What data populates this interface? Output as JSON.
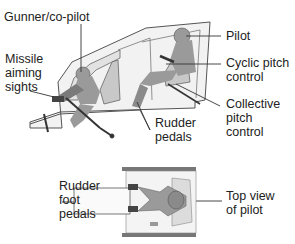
{
  "diagram": {
    "side_view": {
      "labels": {
        "gunner": "Gunner/co-pilot",
        "missile_line1": "Missile",
        "missile_line2": "aiming",
        "missile_line3": "sights",
        "pilot": "Pilot",
        "cyclic_line1": "Cyclic pitch",
        "cyclic_line2": "control",
        "collective_line1": "Collective",
        "collective_line2": "pitch",
        "collective_line3": "control",
        "rudder_line1": "Rudder",
        "rudder_line2": "pedals"
      }
    },
    "top_view": {
      "labels": {
        "foot_line1": "Rudder",
        "foot_line2": "foot",
        "foot_line3": "pedals",
        "top_line1": "Top view",
        "top_line2": "of pilot"
      }
    },
    "colors": {
      "figure_fill": "#9a9a9a",
      "figure_dark": "#6e6e6e",
      "cockpit_fill": "#e8e8e8",
      "line": "#333333"
    }
  }
}
